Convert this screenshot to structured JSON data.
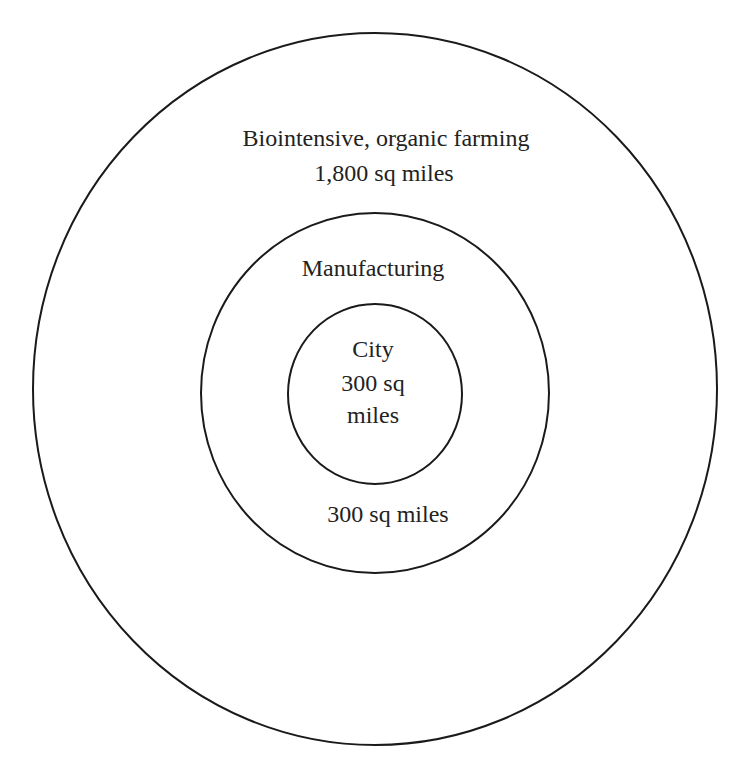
{
  "diagram": {
    "type": "concentric-circles",
    "rings": [
      {
        "name": "outer",
        "label": "Biointensive, organic farming",
        "area": "1,800 sq miles",
        "cx": 375,
        "cy": 389,
        "rx": 342,
        "ry": 356
      },
      {
        "name": "middle",
        "label": "Manufacturing",
        "area": "300 sq miles",
        "cx": 375,
        "cy": 393,
        "rx": 174,
        "ry": 180
      },
      {
        "name": "inner",
        "label": "City",
        "area_line1": "300 sq",
        "area_line2": "miles",
        "cx": 375,
        "cy": 394,
        "rx": 87,
        "ry": 90
      }
    ],
    "stroke_color": "#1a1a1a",
    "text_color": "#222222",
    "background": "#ffffff"
  }
}
